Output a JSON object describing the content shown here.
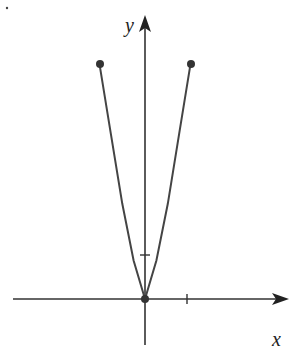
{
  "chart_data": {
    "type": "line",
    "title": "",
    "xlabel": "x",
    "ylabel": "y",
    "series": [
      {
        "name": "curve",
        "x": [
          -1,
          -0.75,
          -0.5,
          -0.25,
          0,
          0.25,
          0.5,
          0.75,
          1
        ],
        "y": [
          5.3,
          3.72,
          2.15,
          0.87,
          0,
          0.87,
          2.15,
          3.72,
          5.3
        ]
      }
    ],
    "points": [
      {
        "x": -1,
        "y": 5.3,
        "filled": true
      },
      {
        "x": 0,
        "y": 0,
        "filled": true
      },
      {
        "x": 1,
        "y": 5.3,
        "filled": true
      }
    ],
    "x_ticks": [
      1
    ],
    "y_ticks": [
      1
    ],
    "xlim": [
      -3,
      3.2
    ],
    "ylim": [
      -1,
      6.4
    ],
    "grid": false
  },
  "axes": {
    "x_label": "x",
    "y_label": "y"
  }
}
